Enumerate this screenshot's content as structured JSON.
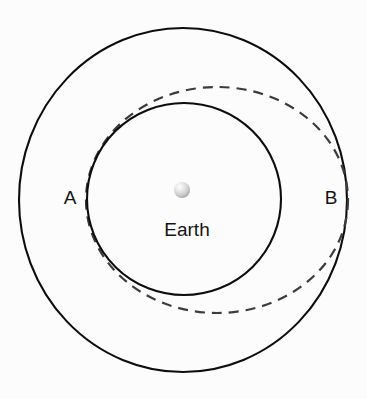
{
  "figure": {
    "kind": "orbital-transfer-diagram",
    "background_color": "#fcfcfd",
    "width": 367,
    "height": 399
  },
  "central_body": {
    "label": "Earth",
    "icon_name": "earth-sphere-icon",
    "center_x": 182,
    "center_y": 190,
    "radius": 8,
    "fill_highlight": "#f6f6f6",
    "fill_shadow": "#a8a8a8"
  },
  "orbits": {
    "inner": {
      "name": "inner-circular-orbit",
      "center_x": 184,
      "center_y": 199,
      "rx": 97,
      "ry": 96,
      "style": "solid",
      "color": "#0d0d0d",
      "stroke_width": 2.1
    },
    "outer": {
      "name": "outer-circular-orbit",
      "center_x": 183,
      "center_y": 200,
      "rx": 164,
      "ry": 172,
      "style": "solid",
      "color": "#0d0d0d",
      "stroke_width": 2.1
    },
    "transfer": {
      "name": "transfer-ellipse-orbit",
      "center_x": 217,
      "center_y": 200,
      "rx": 131,
      "ry": 113,
      "rotation_deg": 0,
      "style": "dashed",
      "color": "#3c3c3c",
      "stroke_width": 2.2,
      "dash_on": 10,
      "dash_off": 7
    }
  },
  "labels": {
    "point_a": {
      "text": "A",
      "x": 70,
      "y": 199
    },
    "point_b": {
      "text": "B",
      "x": 331,
      "y": 199
    },
    "earth": {
      "text": "Earth",
      "x": 187,
      "y": 231
    }
  }
}
